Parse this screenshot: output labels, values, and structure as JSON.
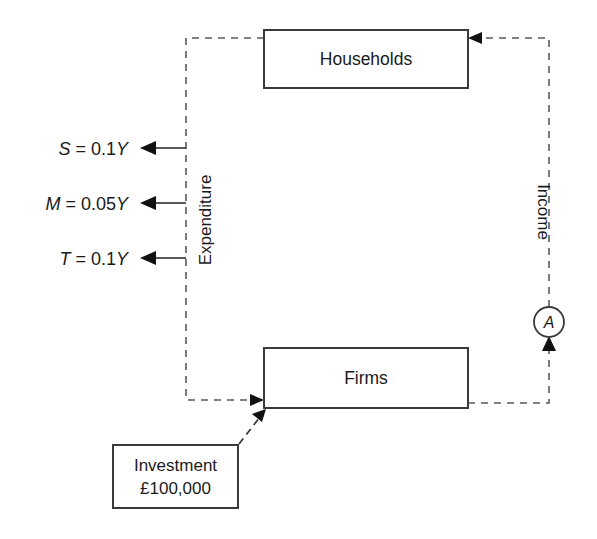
{
  "diagram": {
    "type": "circular-flow-of-income",
    "nodes": [
      {
        "id": "households",
        "label": "Households",
        "x": 264,
        "y": 30,
        "w": 204,
        "h": 58
      },
      {
        "id": "firms",
        "label": "Firms",
        "x": 264,
        "y": 348,
        "w": 204,
        "h": 60
      },
      {
        "id": "investment",
        "label_line1": "Investment",
        "label_line2": "£100,000",
        "x": 113,
        "y": 445,
        "w": 125,
        "h": 63
      }
    ],
    "flows": [
      {
        "id": "expenditure",
        "label": "Expenditure",
        "orientation": "vertical-left",
        "style": "dashed",
        "from": "households",
        "to": "firms"
      },
      {
        "id": "income",
        "label": "Income",
        "orientation": "vertical-right",
        "style": "dashed",
        "from": "firms",
        "to": "households"
      },
      {
        "id": "investment-injection",
        "label": "",
        "style": "dashed-diagonal",
        "from": "investment",
        "to": "firms"
      }
    ],
    "leakages": [
      {
        "id": "savings",
        "symbol": "S",
        "equals": "=",
        "coefficient": "0.1",
        "variable": "Y",
        "text": "S = 0.1Y",
        "y": 148
      },
      {
        "id": "imports",
        "symbol": "M",
        "equals": "=",
        "coefficient": "0.05",
        "variable": "Y",
        "text": "M = 0.05Y",
        "y": 203
      },
      {
        "id": "taxes",
        "symbol": "T",
        "equals": "=",
        "coefficient": "0.1",
        "variable": "Y",
        "text": "T = 0.1Y",
        "y": 258
      }
    ],
    "markers": [
      {
        "id": "point-a",
        "letter": "A",
        "cx": 549,
        "cy": 322,
        "r": 15
      }
    ],
    "colors": {
      "box_stroke": "#3a3a3a",
      "dashed_stroke": "#5a5a5a",
      "leak_stroke": "#222222",
      "text": "#1a1a1a",
      "background": "#ffffff",
      "arrow_fill": "#111111"
    }
  }
}
